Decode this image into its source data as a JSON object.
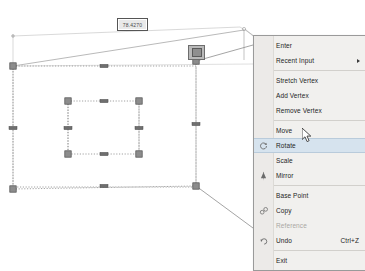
{
  "app": {
    "name": "CAD drawing canvas",
    "background_color": "#ffffff",
    "selection_color": "#6e6e6e",
    "highlight_color": "#d6e3ee"
  },
  "canvas": {
    "dimension_tooltip": {
      "name": "dimension-input",
      "value": "78.4270",
      "x": 117,
      "y": 18,
      "width": 29,
      "height": 11
    },
    "hovered_grip": {
      "x": 188,
      "y": 45,
      "width": 15,
      "height": 13
    },
    "grips": [
      {
        "x": 13,
        "y": 66
      },
      {
        "x": 196,
        "y": 61
      },
      {
        "x": 196,
        "y": 186
      },
      {
        "x": 13,
        "y": 189
      },
      {
        "x": 68,
        "y": 101
      },
      {
        "x": 139,
        "y": 101
      },
      {
        "x": 139,
        "y": 154
      },
      {
        "x": 68,
        "y": 154
      }
    ],
    "midpoint_grips": [
      {
        "x": 104,
        "y": 66
      },
      {
        "x": 104,
        "y": 186
      },
      {
        "x": 104,
        "y": 101
      },
      {
        "x": 104,
        "y": 154
      },
      {
        "x": 13,
        "y": 128
      },
      {
        "x": 196,
        "y": 124
      },
      {
        "x": 68,
        "y": 128
      },
      {
        "x": 139,
        "y": 128
      }
    ]
  },
  "context_menu": {
    "name": "right-click-context-menu",
    "items": [
      {
        "label": "Enter",
        "icon": null,
        "state": "normal",
        "shortcut": "",
        "submenu": false
      },
      {
        "label": "Recent Input",
        "icon": null,
        "state": "normal",
        "shortcut": "",
        "submenu": true
      },
      {
        "separator": true
      },
      {
        "label": "Stretch Vertex",
        "icon": null,
        "state": "normal",
        "shortcut": "",
        "submenu": false
      },
      {
        "label": "Add Vertex",
        "icon": null,
        "state": "normal",
        "shortcut": "",
        "submenu": false
      },
      {
        "label": "Remove Vertex",
        "icon": null,
        "state": "normal",
        "shortcut": "",
        "submenu": false
      },
      {
        "separator": true
      },
      {
        "label": "Move",
        "icon": null,
        "state": "normal",
        "shortcut": "",
        "submenu": false
      },
      {
        "label": "Rotate",
        "icon": "rotate-icon",
        "state": "selected",
        "shortcut": "",
        "submenu": false
      },
      {
        "label": "Scale",
        "icon": null,
        "state": "normal",
        "shortcut": "",
        "submenu": false
      },
      {
        "label": "Mirror",
        "icon": "mirror-icon",
        "state": "normal",
        "shortcut": "",
        "submenu": false
      },
      {
        "separator": true
      },
      {
        "label": "Base Point",
        "icon": null,
        "state": "normal",
        "shortcut": "",
        "submenu": false
      },
      {
        "label": "Copy",
        "icon": "copy-icon",
        "state": "normal",
        "shortcut": "",
        "submenu": false
      },
      {
        "label": "Reference",
        "icon": null,
        "state": "disabled",
        "shortcut": "",
        "submenu": false
      },
      {
        "label": "Undo",
        "icon": "undo-icon",
        "state": "normal",
        "shortcut": "Ctrl+Z",
        "submenu": false
      },
      {
        "separator": true
      },
      {
        "label": "Exit",
        "icon": null,
        "state": "normal",
        "shortcut": "",
        "submenu": false
      }
    ]
  },
  "cursor": {
    "name": "mouse-pointer",
    "x": 302,
    "y": 128
  }
}
